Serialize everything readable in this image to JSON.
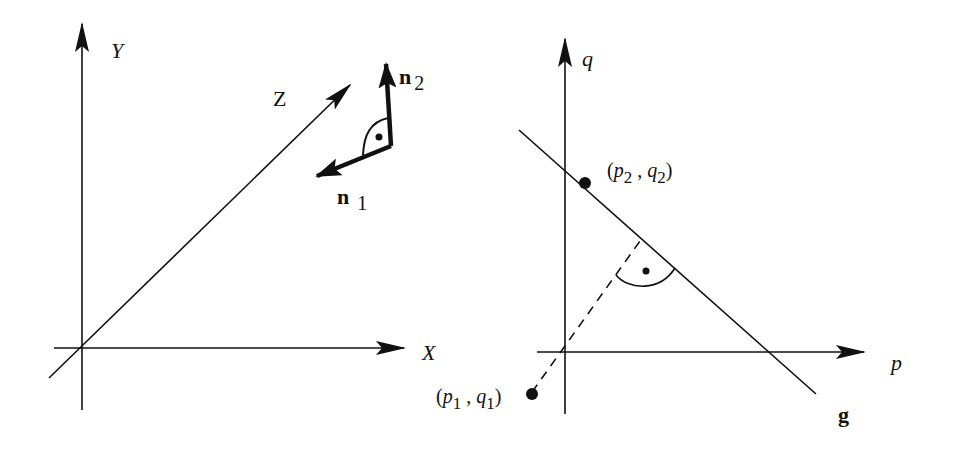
{
  "left_diagram": {
    "axes": {
      "x_label": "X",
      "y_label": "Y",
      "z_label": "Z"
    },
    "vectors": {
      "n1": {
        "symbol": "n",
        "subscript": "1"
      },
      "n2": {
        "symbol": "n",
        "subscript": "2"
      }
    },
    "right_angle_marker": "perpendicular arc with dot between n1 and n2"
  },
  "right_diagram": {
    "axes": {
      "p_label": "p",
      "q_label": "q"
    },
    "line_label": "g",
    "points": {
      "point1": {
        "open": "(",
        "p": "p",
        "p_sub": "1",
        "sep": ",",
        "q": "q",
        "q_sub": "1",
        "close": ")"
      },
      "point2": {
        "open": "(",
        "p": "p",
        "p_sub": "2",
        "sep": ",",
        "q": "q",
        "q_sub": "2",
        "close": ")"
      }
    },
    "perpendicular": "dashed line from (p1,q1) through origin perpendicular to g, right-angle arc with dot"
  },
  "colors": {
    "ink": "#111111",
    "background": "#ffffff"
  }
}
